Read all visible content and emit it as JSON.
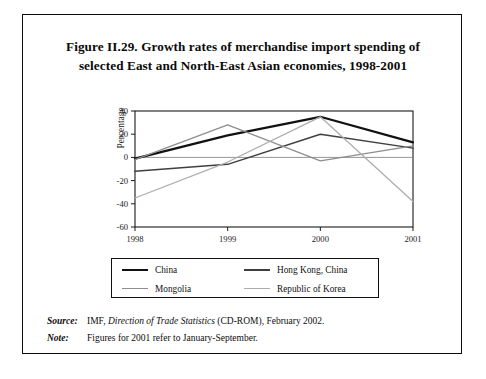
{
  "figure": {
    "title_line_1": "Figure II.29.  Growth rates of merchandise import spending of",
    "title_line_2": "selected East and North-East Asian economies, 1998-2001"
  },
  "notes": {
    "source_tag": "Source:",
    "source_text_before": "IMF,",
    "source_text_italic": "Direction of Trade Statistics",
    "source_text_after": "(CD-ROM), February 2002.",
    "note_tag": "Note:",
    "note_text": "Figures for 2001 refer to January-September."
  },
  "legend": {
    "entries": [
      {
        "label": "China",
        "color": "#111111"
      },
      {
        "label": "Hong Kong, China",
        "color": "#3f3f3f"
      },
      {
        "label": "Mongolia",
        "color": "#8e8e8e"
      },
      {
        "label": "Republic of Korea",
        "color": "#adadad"
      }
    ]
  },
  "chart_data": {
    "type": "line",
    "title": "Growth rates of merchandise import spending of selected East and North-East Asian economies, 1998-2001",
    "xlabel": "",
    "ylabel": "Percentage",
    "categories": [
      "1998",
      "1999",
      "2000",
      "2001"
    ],
    "x_tick_labels": [
      "1998",
      "1999",
      "2000",
      "2001"
    ],
    "y_tick_labels": [
      "40",
      "20",
      "0",
      "-20",
      "-40",
      "-60"
    ],
    "y_ticks": [
      40,
      20,
      0,
      -20,
      -40,
      -60
    ],
    "ylim": [
      -60,
      40
    ],
    "grid": false,
    "zero_line": true,
    "legend_position": "below-plot",
    "series": [
      {
        "name": "China",
        "color": "#111111",
        "width": 2.2,
        "values": [
          -1,
          19,
          35,
          13
        ]
      },
      {
        "name": "Hong Kong, China",
        "color": "#3f3f3f",
        "width": 1.5,
        "values": [
          -12,
          -6,
          20,
          8
        ]
      },
      {
        "name": "Mongolia",
        "color": "#8e8e8e",
        "width": 1.3,
        "values": [
          -2,
          28,
          -3,
          10
        ]
      },
      {
        "name": "Republic of Korea",
        "color": "#adadad",
        "width": 1.3,
        "values": [
          -35,
          -4,
          35,
          -38
        ]
      }
    ]
  }
}
